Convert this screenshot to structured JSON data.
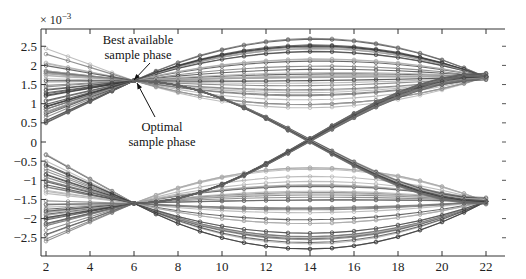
{
  "chart_data": {
    "type": "line",
    "title": "",
    "subtitle": "",
    "xlabel": "",
    "ylabel": "",
    "y_multiplier_label": "× 10^-3",
    "y_multiplier_base": "× 10",
    "y_multiplier_exp": "−3",
    "xlim": [
      1.8,
      22.8
    ],
    "ylim": [
      -2.95,
      2.95
    ],
    "x_ticks": [
      2,
      4,
      6,
      8,
      10,
      12,
      14,
      16,
      18,
      20,
      22
    ],
    "x_tick_labels": [
      "2",
      "4",
      "6",
      "8",
      "10",
      "12",
      "14",
      "16",
      "18",
      "20",
      "22"
    ],
    "y_ticks": [
      2.5,
      2,
      1.5,
      1,
      0.5,
      0,
      -0.5,
      -1,
      -1.5,
      -2,
      -2.5
    ],
    "y_tick_labels": [
      "2.5",
      "2",
      "1.5",
      "1",
      "0.5",
      "0",
      "−0.5",
      "−1",
      "−1.5",
      "−2",
      "−2.5"
    ],
    "grid": false,
    "legend": null,
    "x": [
      2,
      3,
      4,
      5,
      6,
      7,
      8,
      9,
      10,
      11,
      12,
      13,
      14,
      15,
      16,
      17,
      18,
      19,
      20,
      21,
      22
    ],
    "convergence_points": [
      {
        "x": 6,
        "y": 1.6
      },
      {
        "x": 6,
        "y": -1.6
      },
      {
        "x": 22,
        "y": 1.7
      },
      {
        "x": 22,
        "y": -1.55
      }
    ],
    "trace_envelope": {
      "upper_rail_max": [
        2.5,
        2.3,
        2.1,
        1.85,
        1.6,
        1.9,
        2.15,
        2.35,
        2.5,
        2.62,
        2.7,
        2.75,
        2.78,
        2.75,
        2.7,
        2.6,
        2.45,
        2.3,
        2.1,
        1.9,
        1.7
      ],
      "upper_rail_min": [
        0.3,
        0.6,
        0.95,
        1.3,
        1.6,
        1.4,
        1.2,
        1.0,
        0.9,
        0.8,
        0.75,
        0.72,
        0.7,
        0.72,
        0.75,
        0.85,
        1.0,
        1.15,
        1.3,
        1.5,
        1.7
      ],
      "lower_rail_max": [
        -0.3,
        -0.6,
        -0.95,
        -1.3,
        -1.6,
        -1.35,
        -1.1,
        -0.9,
        -0.8,
        -0.75,
        -0.7,
        -0.68,
        -0.66,
        -0.68,
        -0.72,
        -0.8,
        -0.95,
        -1.1,
        -1.25,
        -1.4,
        -1.55
      ],
      "lower_rail_min": [
        -2.6,
        -2.35,
        -2.15,
        -1.9,
        -1.6,
        -1.95,
        -2.2,
        -2.4,
        -2.55,
        -2.65,
        -2.72,
        -2.78,
        -2.8,
        -2.78,
        -2.72,
        -2.62,
        -2.48,
        -2.3,
        -2.1,
        -1.85,
        -1.55
      ]
    },
    "annotations": [
      {
        "text_lines": [
          "Best available",
          "sample phase"
        ],
        "arrow_to": {
          "x": 6,
          "y": 1.6
        }
      },
      {
        "text_lines": [
          "Optimal",
          "sample phase"
        ],
        "arrow_to": {
          "x": 6.2,
          "y": 1.55
        }
      }
    ],
    "trace_count_per_rail": 34,
    "colors": {
      "dark_trace": "#3a3a3a",
      "mid_trace": "#6e6e6e",
      "light_trace": "#a8a8a8",
      "axis": "#333333"
    }
  }
}
